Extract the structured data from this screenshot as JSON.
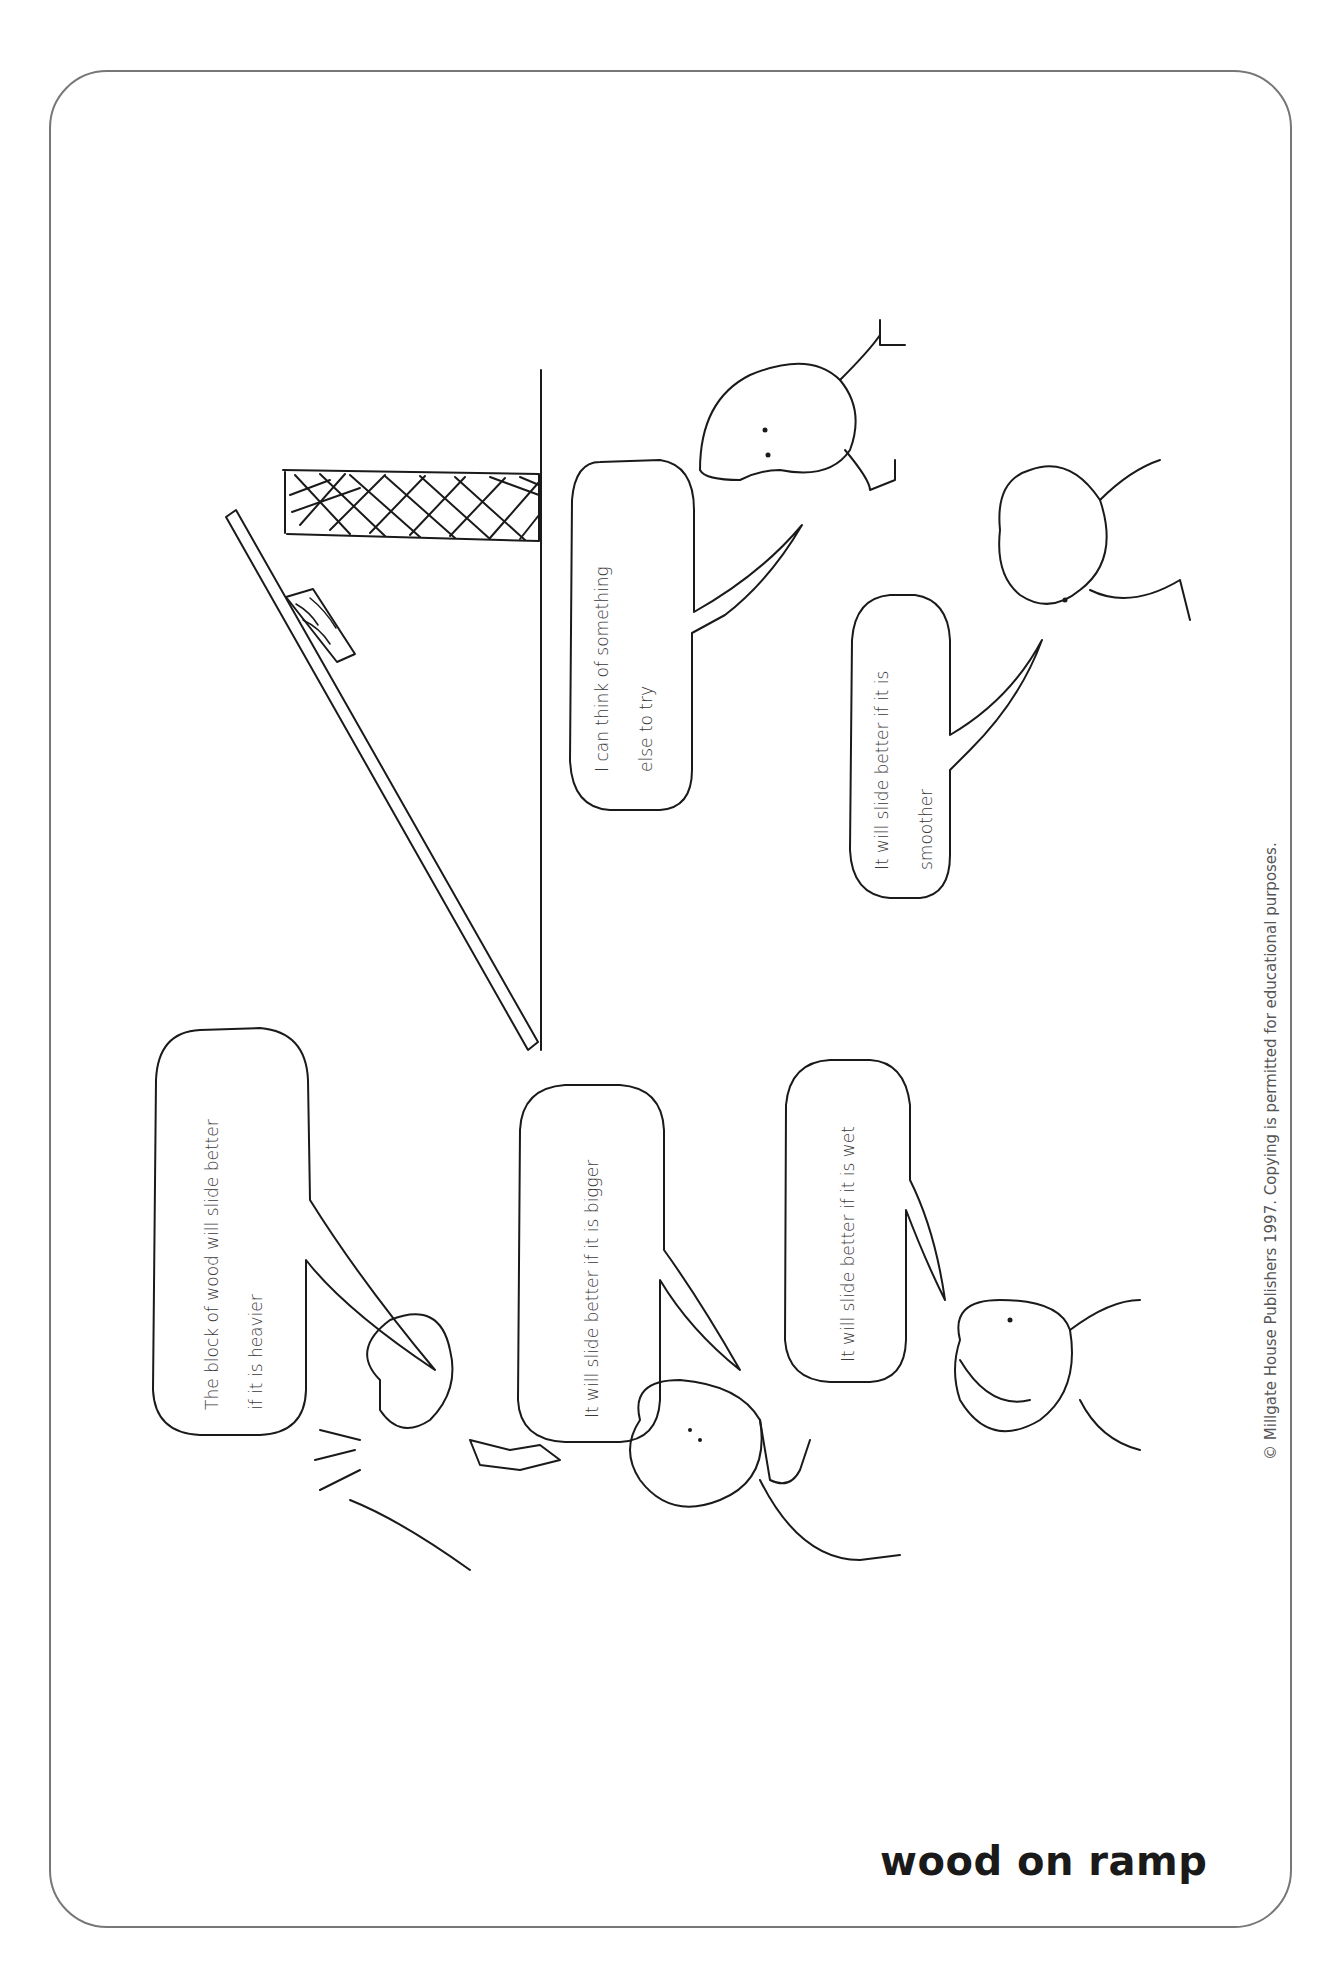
{
  "worksheet": {
    "title": "wood on ramp",
    "copyright": "© Millgate House Publishers 1997. Copying is permitted for educational purposes."
  },
  "speech_bubbles": [
    {
      "id": "heavier",
      "lines": [
        "The block of wood will slide better",
        "if it is heavier"
      ]
    },
    {
      "id": "bigger",
      "lines": [
        "It will slide better if it is bigger"
      ]
    },
    {
      "id": "wet",
      "lines": [
        "It will slide better if it is wet"
      ]
    },
    {
      "id": "something-else",
      "lines": [
        "I can think of something",
        "else to try"
      ]
    },
    {
      "id": "smoother",
      "lines": [
        "It will slide better if it is",
        "smoother"
      ]
    }
  ],
  "illustration": {
    "scene": "ramp-with-wooden-block",
    "characters": 5
  },
  "colors": {
    "ink": "#1a1a1a",
    "border": "#777777",
    "paper": "#ffffff"
  }
}
